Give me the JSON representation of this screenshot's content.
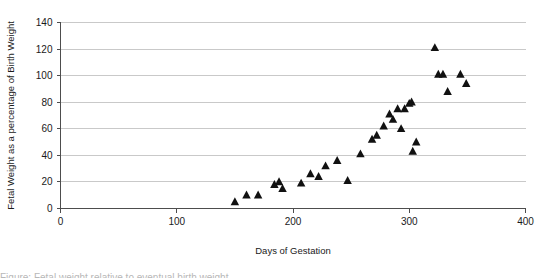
{
  "chart_data": {
    "type": "scatter",
    "title": "",
    "xlabel": "Days of Gestation",
    "ylabel": "Fetal Weight as a percentage of Birth Weight",
    "xlim": [
      0,
      400
    ],
    "ylim": [
      0,
      140
    ],
    "xticks": [
      0,
      100,
      200,
      300,
      400
    ],
    "yticks": [
      0,
      20,
      40,
      60,
      80,
      100,
      120,
      140
    ],
    "grid": "horizontal",
    "legend": "none",
    "marker": "triangle",
    "marker_color": "#111111",
    "series": [
      {
        "name": "Fetal weight vs gestation",
        "points": [
          [
            150,
            5
          ],
          [
            160,
            10
          ],
          [
            170,
            10
          ],
          [
            184,
            18
          ],
          [
            188,
            20
          ],
          [
            191,
            15
          ],
          [
            207,
            19
          ],
          [
            215,
            26
          ],
          [
            222,
            24
          ],
          [
            228,
            32
          ],
          [
            238,
            36
          ],
          [
            247,
            21
          ],
          [
            258,
            41
          ],
          [
            268,
            52
          ],
          [
            272,
            55
          ],
          [
            278,
            62
          ],
          [
            283,
            71
          ],
          [
            286,
            67
          ],
          [
            290,
            75
          ],
          [
            293,
            60
          ],
          [
            296,
            75
          ],
          [
            300,
            79
          ],
          [
            302,
            80
          ],
          [
            303,
            43
          ],
          [
            306,
            50
          ],
          [
            322,
            121
          ],
          [
            325,
            101
          ],
          [
            329,
            101
          ],
          [
            333,
            88
          ],
          [
            344,
            101
          ],
          [
            349,
            94
          ]
        ]
      }
    ]
  },
  "caption": {
    "line": "Figure: Fetal weight relative to eventual birth weight"
  }
}
